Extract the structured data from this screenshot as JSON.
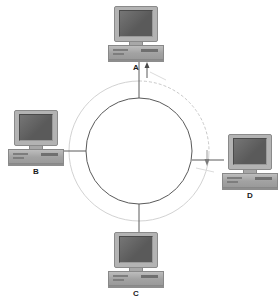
{
  "diagram": {
    "type": "ring-topology",
    "background_color": "#ffffff"
  },
  "nodes": [
    {
      "id": "a",
      "label": "A",
      "position": "top",
      "device": "desktop-computer"
    },
    {
      "id": "b",
      "label": "B",
      "position": "left",
      "device": "desktop-computer"
    },
    {
      "id": "c",
      "label": "C",
      "position": "bottom",
      "device": "desktop-computer"
    },
    {
      "id": "d",
      "label": "D",
      "position": "right",
      "device": "desktop-computer"
    }
  ],
  "rings": {
    "inner": {
      "name": "signal-ring",
      "stroke": "#5a5a5a",
      "style": "solid",
      "cx": 139,
      "cy": 151,
      "r": 53
    },
    "outer": {
      "name": "token-flow-ring",
      "stroke": "#c9c9c9",
      "style": "dashed",
      "cx": 139,
      "cy": 151,
      "r": 70,
      "direction": "clockwise"
    }
  },
  "spokes": [
    {
      "from": "ring",
      "to": "a",
      "orientation": "vertical-up"
    },
    {
      "from": "ring",
      "to": "b",
      "orientation": "horizontal-left"
    },
    {
      "from": "ring",
      "to": "c",
      "orientation": "vertical-down"
    },
    {
      "from": "ring",
      "to": "d",
      "orientation": "horizontal-right"
    }
  ],
  "arrows": [
    {
      "name": "flow-arrow-top",
      "points": "up",
      "near_node": "A"
    },
    {
      "name": "flow-arrow-right",
      "points": "down",
      "near_node": "D"
    }
  ],
  "colors": {
    "monitor_bezel": "#b3b3b3",
    "monitor_screen": "#666666",
    "base_unit": "#ababab",
    "inner_ring": "#5a5a5a",
    "outer_ring": "#c9c9c9",
    "spoke_line": "#5a5a5a",
    "label_text": "#1a1a1a"
  }
}
